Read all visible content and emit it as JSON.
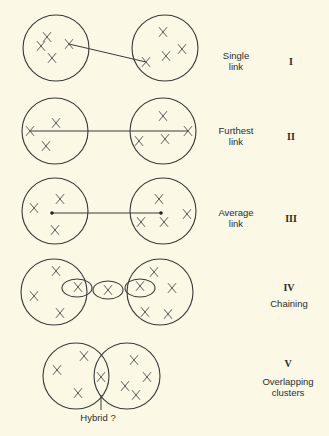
{
  "diagram": {
    "background": "#fbf8e6",
    "stroke_color": "#3a3a3a",
    "panels": [
      {
        "id": "I",
        "numeral": "I",
        "title_lines": [
          "Single",
          "link"
        ],
        "label_pos": {
          "x": 236,
          "y": 50
        },
        "numeral_pos": {
          "x": 291,
          "y": 56
        },
        "circles": [
          {
            "cx": 56,
            "cy": 48,
            "r": 33
          },
          {
            "cx": 165,
            "cy": 48,
            "r": 33
          }
        ],
        "points": [
          [
            47,
            37
          ],
          [
            41,
            46
          ],
          [
            69,
            44
          ],
          [
            52,
            58
          ],
          [
            163,
            32
          ],
          [
            182,
            49
          ],
          [
            166,
            56
          ],
          [
            146,
            62
          ]
        ],
        "lines": [
          [
            69,
            44,
            146,
            62
          ]
        ],
        "dots": []
      },
      {
        "id": "II",
        "numeral": "II",
        "title_lines": [
          "Furthest",
          "link"
        ],
        "label_pos": {
          "x": 236,
          "y": 125
        },
        "numeral_pos": {
          "x": 291,
          "y": 131
        },
        "circles": [
          {
            "cx": 55,
            "cy": 131,
            "r": 33
          },
          {
            "cx": 163,
            "cy": 131,
            "r": 33
          }
        ],
        "points": [
          [
            56,
            123
          ],
          [
            30,
            131
          ],
          [
            46,
            146
          ],
          [
            163,
            116
          ],
          [
            188,
            131
          ],
          [
            139,
            141
          ],
          [
            165,
            139
          ]
        ],
        "lines": [
          [
            30,
            131,
            188,
            131
          ]
        ],
        "dots": []
      },
      {
        "id": "III",
        "numeral": "III",
        "title_lines": [
          "Average",
          "link"
        ],
        "label_pos": {
          "x": 236,
          "y": 207
        },
        "numeral_pos": {
          "x": 291,
          "y": 213
        },
        "circles": [
          {
            "cx": 55,
            "cy": 211,
            "r": 33
          },
          {
            "cx": 163,
            "cy": 211,
            "r": 33
          }
        ],
        "points": [
          [
            34,
            208
          ],
          [
            60,
            199
          ],
          [
            55,
            230
          ],
          [
            159,
            199
          ],
          [
            187,
            214
          ],
          [
            141,
            222
          ],
          [
            164,
            222
          ]
        ],
        "lines": [
          [
            52,
            213,
            161,
            213
          ]
        ],
        "dots": [
          [
            52,
            213
          ],
          [
            161,
            213
          ]
        ]
      },
      {
        "id": "IV",
        "numeral": "IV",
        "title_lines": [
          "Chaining"
        ],
        "label_pos": {
          "x": 289,
          "y": 298
        },
        "numeral_pos": {
          "x": 289,
          "y": 282
        },
        "circles": [
          {
            "cx": 54,
            "cy": 292,
            "r": 33
          },
          {
            "cx": 160,
            "cy": 292,
            "r": 33
          }
        ],
        "ellipses": [
          {
            "cx": 77,
            "cy": 288,
            "rx": 15,
            "ry": 9
          },
          {
            "cx": 108,
            "cy": 290,
            "rx": 15,
            "ry": 9
          },
          {
            "cx": 140,
            "cy": 288,
            "rx": 15,
            "ry": 9
          }
        ],
        "points": [
          [
            56,
            271
          ],
          [
            78,
            287
          ],
          [
            34,
            296
          ],
          [
            60,
            313
          ],
          [
            108,
            290
          ],
          [
            140,
            286
          ],
          [
            154,
            272
          ],
          [
            172,
            288
          ],
          [
            145,
            312
          ],
          [
            168,
            314
          ]
        ],
        "lines": [],
        "dots": []
      },
      {
        "id": "V",
        "numeral": "V",
        "title_lines": [
          "Overlapping",
          "clusters"
        ],
        "label_pos": {
          "x": 288,
          "y": 376
        },
        "numeral_pos": {
          "x": 288,
          "y": 358
        },
        "circles": [
          {
            "cx": 76,
            "cy": 376,
            "r": 33
          },
          {
            "cx": 127,
            "cy": 376,
            "r": 33
          }
        ],
        "points": [
          [
            57,
            370
          ],
          [
            84,
            356
          ],
          [
            78,
            393
          ],
          [
            101,
            377
          ],
          [
            134,
            360
          ],
          [
            147,
            377
          ],
          [
            125,
            386
          ],
          [
            136,
            395
          ]
        ],
        "lines": [
          [
            101,
            395,
            101,
            410
          ]
        ],
        "dots": [],
        "annotation": {
          "text": "Hybrid ?",
          "x": 98,
          "y": 412
        }
      }
    ]
  }
}
